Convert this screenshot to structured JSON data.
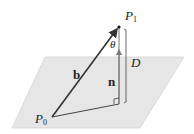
{
  "figure": {
    "type": "geometry-diagram",
    "colors": {
      "plane_fill": "#e6e6e6",
      "plane_edge": "#d4d4d4",
      "line": "#333333",
      "normal": "#777777"
    },
    "labels": {
      "p1": {
        "main": "P",
        "sub": "1"
      },
      "p0": {
        "main": "P",
        "sub": "0"
      },
      "theta": "θ",
      "distance": "D",
      "vector_b": "b",
      "vector_n": "n"
    }
  }
}
